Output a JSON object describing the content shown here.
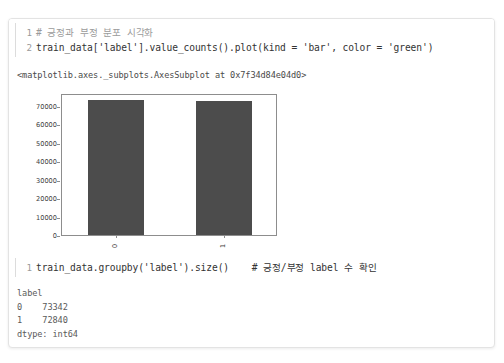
{
  "notebook": {
    "cells": [
      {
        "type": "code",
        "lines": [
          {
            "number": "1",
            "text": "# 긍정과 부정 분포 시각화",
            "style": "comment"
          },
          {
            "number": "2",
            "text": "train_data['label'].value_counts().plot(kind = 'bar', color = 'green')",
            "style": "code"
          }
        ]
      },
      {
        "type": "text-output",
        "text": "<matplotlib.axes._subplots.AxesSubplot at 0x7f34d84e04d0>"
      },
      {
        "type": "chart"
      },
      {
        "type": "code",
        "lines": [
          {
            "number": "1",
            "text": "train_data.groupby('label').size()    # 긍정/부정 label 수 확인",
            "style": "code"
          }
        ]
      },
      {
        "type": "stream-output",
        "text": "label\n0    73342\n1    72840\ndtype: int64"
      }
    ]
  },
  "chart_data": {
    "type": "bar",
    "title": "",
    "xlabel": "",
    "ylabel": "",
    "categories": [
      "0",
      "1"
    ],
    "values": [
      73342,
      72840
    ],
    "ylim": [
      0,
      77000
    ],
    "yticks": [
      0,
      10000,
      20000,
      30000,
      40000,
      50000,
      60000,
      70000
    ],
    "ytick_labels": [
      "0",
      "10000",
      "20000",
      "30000",
      "40000",
      "50000",
      "60000",
      "70000"
    ],
    "xtick_labels": [
      "0",
      "1"
    ],
    "xtick_rotation": 90,
    "bar_color": "#4c4c4c",
    "requested_color": "green",
    "grid": false,
    "legend": false
  },
  "colors": {
    "card_border": "#e3e3e3",
    "axis": "#8d8d8d",
    "code_text": "#333333",
    "comment_text": "#9b9b9b",
    "output_text": "#4a4a4a",
    "line_number": "#9a9a9a"
  }
}
